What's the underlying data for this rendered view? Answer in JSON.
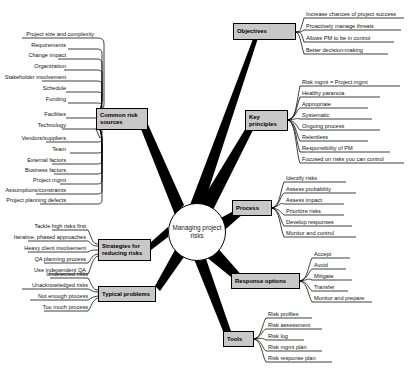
{
  "diagram": {
    "type": "mind-map",
    "center": {
      "label": "Managing project risks"
    },
    "colors": {
      "branch_fill": "#c8c8c8",
      "stroke": "#000000",
      "center_fill": "#ffffff",
      "text": "#111111"
    },
    "branches": [
      {
        "id": "objectives",
        "label": "Objectives",
        "side": "right",
        "leaves": [
          "Increase chances of project success",
          "Proactively manage threats",
          "Allows PM to be in control",
          "Better decision-making"
        ]
      },
      {
        "id": "key-principles",
        "label": "Key principles",
        "side": "right",
        "leaves": [
          "Risk mgmt = Project mgmt",
          "Healthy paranoia",
          "Appropriate",
          "Systematic",
          "Ongoing process",
          "Relentless",
          "Responsibility of PM",
          "Focused on risks you can control"
        ]
      },
      {
        "id": "process",
        "label": "Process",
        "side": "right",
        "leaves": [
          "Identify risks",
          "Assess probability",
          "Assess impact",
          "Prioritize risks",
          "Develop responses",
          "Monitor and control"
        ]
      },
      {
        "id": "response-options",
        "label": "Response options",
        "side": "right",
        "leaves": [
          "Accept",
          "Avoid",
          "Mitigate",
          "Transfer",
          "Monitor and prepare"
        ]
      },
      {
        "id": "tools",
        "label": "Tools",
        "side": "right",
        "leaves": [
          "Risk profiles",
          "Risk assessment",
          "Risk log",
          "Risk mgmt plan",
          "Risk response plan"
        ]
      },
      {
        "id": "common-risk-sources",
        "label": "Common risk sources",
        "side": "left",
        "leaves": [
          "Project size and complexity",
          "Requirements",
          "Change impact",
          "Organization",
          "Stakeholder involvement",
          "Schedule",
          "Funding",
          "Facilities",
          "Technology",
          "Vendors/suppliers",
          "Team",
          "External factors",
          "Business factors",
          "Project mgmt",
          "Assumptions/constraints",
          "Project planning defects"
        ]
      },
      {
        "id": "strategies-for-reducing-risks",
        "label": "Strategies for reducing risks",
        "side": "left",
        "leaves": [
          "Tackle high risks first",
          "Iterative, phased approaches",
          "Heavy client involvement",
          "QA planning process",
          "Use independent QA"
        ]
      },
      {
        "id": "typical-problems",
        "label": "Typical problems",
        "side": "left",
        "leaves": [
          "Undetected risks",
          "Unacknowledged risks",
          "Not enough process",
          "Too much process"
        ]
      }
    ]
  }
}
